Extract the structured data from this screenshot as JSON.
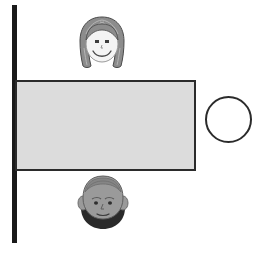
{
  "scene": {
    "title": "Two faces separated by a wall and a gray panel, with an open circle at right",
    "width": 267,
    "height": 255,
    "background_color": "#ffffff"
  },
  "colors": {
    "outline": "#2b2b2b",
    "wall": "#1a1a1a",
    "panel_fill": "#dcdcdc",
    "circle_fill": "#ffffff",
    "girl_hair": "#8c8c8c",
    "girl_hair_shade": "#a8a8a8",
    "girl_skin": "#f2f2f2",
    "man_skin": "#9a9a9a",
    "man_skin_shade": "#8a8a8a",
    "man_beard": "#2a2a2a",
    "feature_stroke": "#4a4a4a"
  },
  "elements": {
    "wall": {
      "name": "vertical-wall-bar",
      "label": "Vertical black bar",
      "x": 12,
      "y": 5,
      "width": 5,
      "height": 238
    },
    "panel": {
      "name": "gray-panel",
      "label": "Gray rectangular panel",
      "x": 15,
      "y": 80,
      "width": 181,
      "height": 91,
      "fill": "#dcdcdc",
      "stroke": "#2b2b2b"
    },
    "circle": {
      "name": "open-circle",
      "label": "Open white circle",
      "x": 205,
      "y": 96,
      "diameter": 47,
      "fill": "#ffffff",
      "stroke": "#2b2b2b"
    },
    "girl_face": {
      "name": "girl-face",
      "label": "Smiling face with long hair",
      "x": 73,
      "y": 14,
      "width": 58,
      "height": 58,
      "expression": "smiling",
      "hair": "long",
      "position": "above-panel"
    },
    "man_face": {
      "name": "bearded-man-face",
      "label": "Face with dark beard",
      "x": 76,
      "y": 174,
      "width": 54,
      "height": 58,
      "expression": "neutral",
      "hair": "beard",
      "position": "below-panel"
    }
  }
}
